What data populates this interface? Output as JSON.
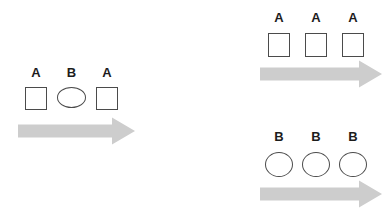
{
  "page": {
    "background": "#ffffff"
  },
  "colors": {
    "arrow_fill": "#cdcdcd",
    "shape_stroke": "#4b4b4b",
    "label_color": "#1c1c1c"
  },
  "groups": {
    "left": {
      "items": [
        {
          "label": "A",
          "shape": "square"
        },
        {
          "label": "B",
          "shape": "ellipse"
        },
        {
          "label": "A",
          "shape": "square"
        }
      ],
      "arrow_icon": "right-arrow"
    },
    "top_right": {
      "items": [
        {
          "label": "A",
          "shape": "square"
        },
        {
          "label": "A",
          "shape": "square"
        },
        {
          "label": "A",
          "shape": "square"
        }
      ],
      "arrow_icon": "right-arrow"
    },
    "bottom_right": {
      "items": [
        {
          "label": "B",
          "shape": "ellipse"
        },
        {
          "label": "B",
          "shape": "ellipse"
        },
        {
          "label": "B",
          "shape": "ellipse"
        }
      ],
      "arrow_icon": "right-arrow"
    }
  }
}
